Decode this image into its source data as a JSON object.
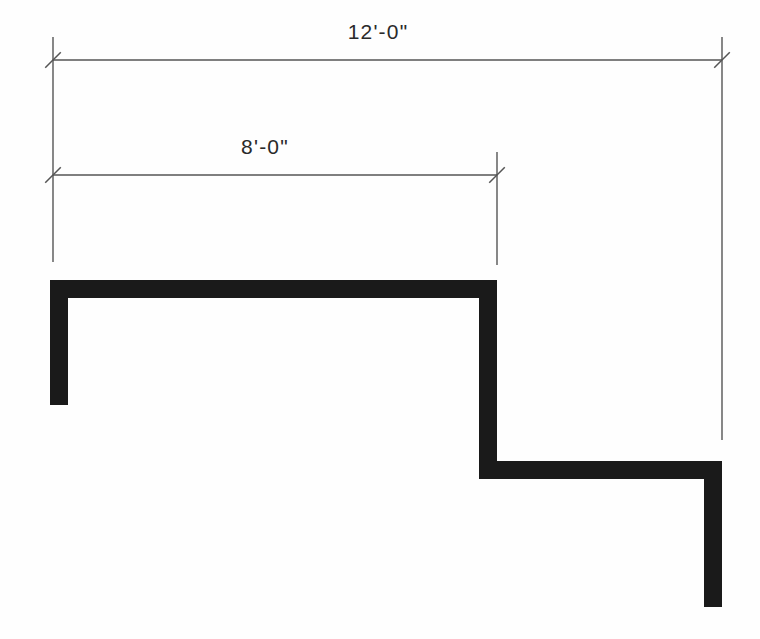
{
  "drawing": {
    "title": "Stepped wall plan with horizontal dimensions",
    "background_color": "#fefefe",
    "wall_color": "#1a1a1a",
    "dimension_line_color": "#555555",
    "text_color": "#2a2a2a",
    "canvas": {
      "width": 760,
      "height": 639
    }
  },
  "dimensions": [
    {
      "id": "overall-width",
      "label": "12'-0\"",
      "feet": 12,
      "inches": 0,
      "line_y": 60,
      "start_x": 53,
      "end_x": 722,
      "label_x": 378,
      "label_y": 39,
      "tick_style": "architectural-slash"
    },
    {
      "id": "first-bay-width",
      "label": "8'-0\"",
      "feet": 8,
      "inches": 0,
      "line_y": 175,
      "start_x": 53,
      "end_x": 497,
      "label_x": 265,
      "label_y": 154,
      "tick_style": "architectural-slash"
    }
  ],
  "extension_lines": [
    {
      "id": "left",
      "x": 53,
      "y_top": 37,
      "y_bottom": 262
    },
    {
      "id": "middle",
      "x": 497,
      "y_top": 152,
      "y_bottom": 265
    },
    {
      "id": "right",
      "x": 722,
      "y_top": 37,
      "y_bottom": 440
    }
  ],
  "wall": {
    "id": "stepped-wall",
    "thickness": 18,
    "points": [
      {
        "x": 59,
        "y": 405
      },
      {
        "x": 59,
        "y": 289
      },
      {
        "x": 488,
        "y": 289
      },
      {
        "x": 488,
        "y": 470
      },
      {
        "x": 713,
        "y": 470
      },
      {
        "x": 713,
        "y": 607
      }
    ],
    "description": "Polyline wall: left leg rises, runs right along top, steps down, runs right again, then drops on right leg"
  },
  "ticks": [
    {
      "id": "tick-top-left",
      "cx": 53,
      "cy": 60,
      "length": 22,
      "angle_deg": -45
    },
    {
      "id": "tick-top-right",
      "cx": 722,
      "cy": 60,
      "length": 22,
      "angle_deg": -45
    },
    {
      "id": "tick-mid-left",
      "cx": 53,
      "cy": 175,
      "length": 22,
      "angle_deg": -45
    },
    {
      "id": "tick-mid-right",
      "cx": 497,
      "cy": 175,
      "length": 22,
      "angle_deg": -45
    }
  ]
}
